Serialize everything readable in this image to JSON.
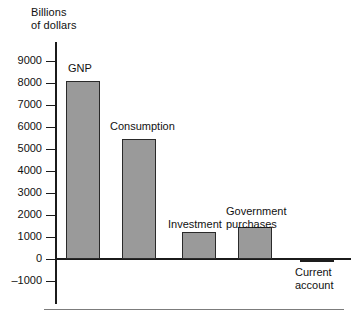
{
  "chart_data": {
    "type": "bar",
    "title": "",
    "xlabel": "",
    "ylabel": "Billions\nof dollars",
    "ylim": [
      -1000,
      9500
    ],
    "grid": false,
    "legend": "none",
    "yticks": [
      9000,
      8000,
      7000,
      6000,
      5000,
      4000,
      3000,
      2000,
      1000,
      0,
      -1000
    ],
    "ytick_labels": [
      "9000",
      "8000",
      "7000",
      "6000",
      "5000",
      "4000",
      "3000",
      "2000",
      "1000",
      "0",
      "–1000"
    ],
    "categories": [
      "GNP",
      "Consumption",
      "Investment",
      "Government purchases",
      "Current account"
    ],
    "values": [
      8100,
      5450,
      1250,
      1450,
      -150
    ],
    "bar_labels": [
      "GNP",
      "Consumption",
      "Investment",
      "Government\npurchases",
      "Current\naccount"
    ],
    "colors": {
      "bar_fill": "#9a9a9a",
      "bar_stroke": "#2a2a2a",
      "negative_fill": "#1d1d1d",
      "axis": "#1b1b1b",
      "text": "#111111",
      "rule": "#7c7c7c"
    }
  }
}
